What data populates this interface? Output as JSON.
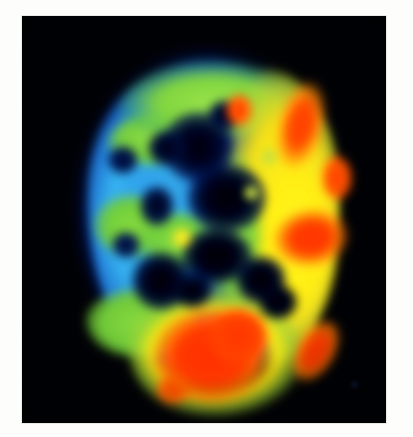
{
  "image": {
    "kind": "medical-scan",
    "modality": "PET",
    "view": "axial",
    "subject": "brain",
    "colormap": "rainbow-jet",
    "background_color": "#000105",
    "mount_color": "#fdfdfb"
  },
  "frame": {
    "left": 22,
    "top": 16,
    "width": 364,
    "height": 407
  },
  "palette": {
    "background": "#000105",
    "lowest": "#05103d",
    "blue": "#1b3fa8",
    "cyan": "#3c96dc",
    "green": "#8ad24e",
    "yellow": "#f5e62c",
    "orange": "#f87a14",
    "red": "#fa3c10"
  },
  "scale": {
    "label": "relative tracer uptake",
    "low_label": "low",
    "high_label": "high"
  },
  "regions": [
    {
      "name": "left-hemisphere-cortex",
      "intensity": "low-moderate",
      "color": "#3c96dc"
    },
    {
      "name": "frontal-cortex",
      "intensity": "moderate",
      "color": "#8ad24e"
    },
    {
      "name": "right-hemisphere-cortex",
      "intensity": "high",
      "color": "#f5e62c"
    },
    {
      "name": "right-frontal-hotspot",
      "intensity": "very-high",
      "color": "#fa3c10"
    },
    {
      "name": "right-temporal-hotspot",
      "intensity": "very-high",
      "color": "#fa3c10"
    },
    {
      "name": "right-parietal-hotspot",
      "intensity": "very-high",
      "color": "#fa3c10"
    },
    {
      "name": "occipital-hotspot",
      "intensity": "very-high",
      "color": "#fa3c10"
    },
    {
      "name": "ventricles-midline",
      "intensity": "none",
      "color": "#01030f"
    }
  ]
}
